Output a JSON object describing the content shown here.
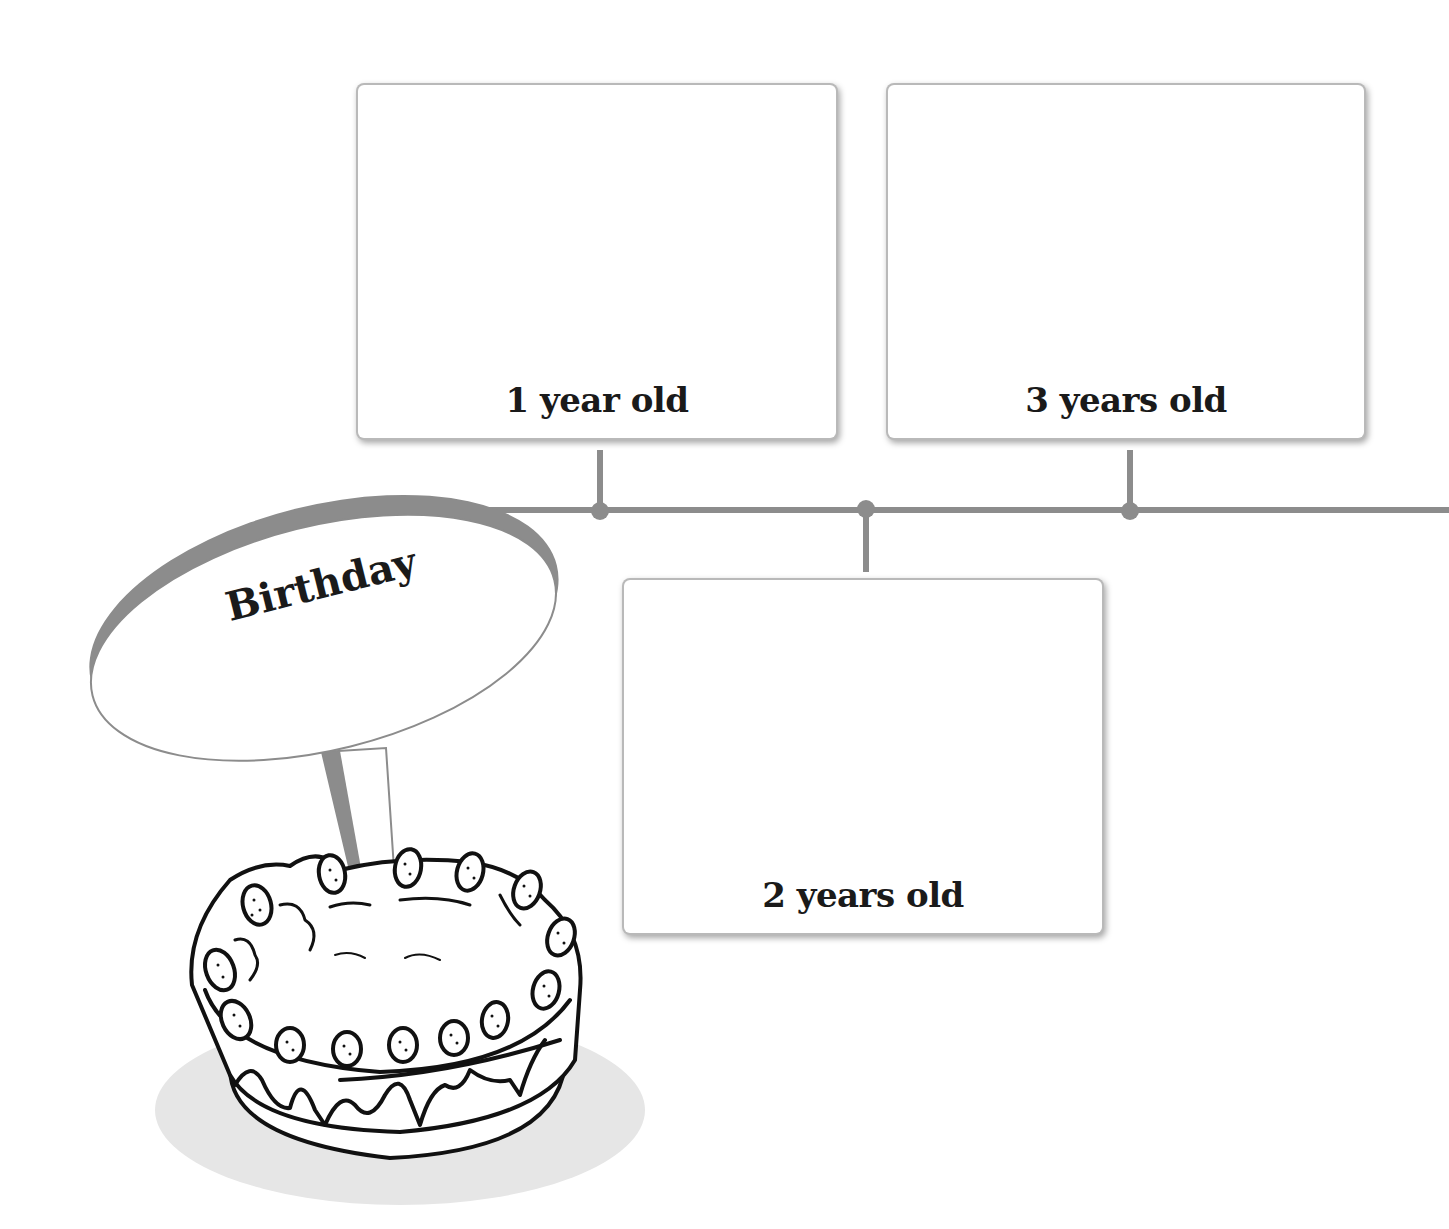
{
  "sign": {
    "title": "Birthday"
  },
  "timeline": {
    "line_color": "#8c8c8c",
    "milestones": [
      {
        "label": "1 year old",
        "position": "above"
      },
      {
        "label": "2 years old",
        "position": "below"
      },
      {
        "label": "3 years old",
        "position": "above"
      }
    ]
  },
  "illustration": {
    "subject": "cake-with-strawberries"
  }
}
